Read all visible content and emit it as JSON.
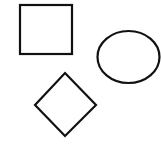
{
  "canvas": {
    "width": 161,
    "height": 146,
    "background": "#ffffff"
  },
  "style": {
    "stroke": "#111111",
    "stroke_width": 2.2,
    "fill": "none"
  },
  "shapes": [
    {
      "type": "square",
      "x": 20,
      "y": 5,
      "width": 52,
      "height": 49
    },
    {
      "type": "ellipse",
      "cx": 128.5,
      "cy": 57,
      "rx": 31,
      "ry": 26
    },
    {
      "type": "diamond",
      "points": [
        [
          65,
          73
        ],
        [
          96,
          105
        ],
        [
          65,
          136
        ],
        [
          35,
          105
        ]
      ]
    }
  ]
}
